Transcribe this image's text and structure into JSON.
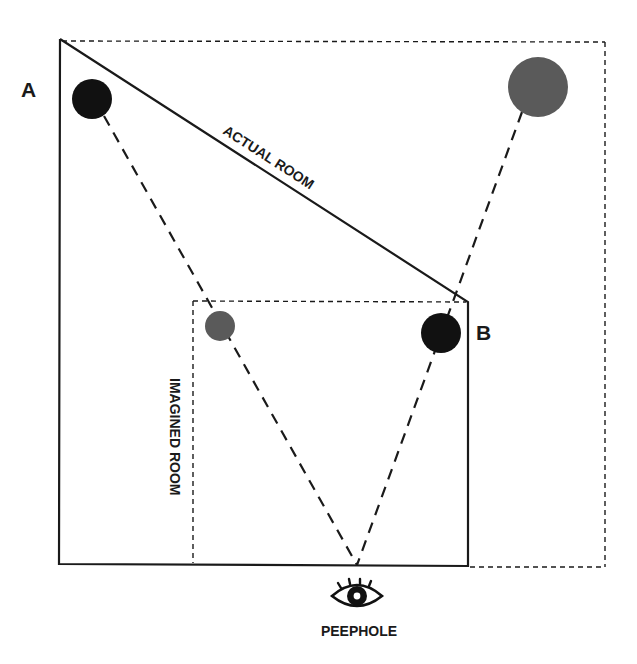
{
  "diagram": {
    "labels": {
      "corner_a": "A",
      "corner_b": "B",
      "actual_room": "ACTUAL ROOM",
      "imagined_room": "IMAGINED ROOM",
      "peephole": "PEEPHOLE"
    },
    "colors": {
      "line": "#1a1a1a",
      "person_actual": "#111111",
      "person_perceived": "#5a5a5a",
      "background": "#ffffff"
    },
    "icons": {
      "peephole": "eye-icon"
    }
  }
}
